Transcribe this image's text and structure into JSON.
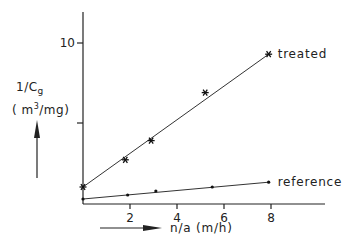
{
  "chart_data": {
    "type": "scatter",
    "title": "",
    "xlabel": "n/a  (m/h)",
    "ylabel": "1/Cg (m3/mg)",
    "ylabel_parts": {
      "main": "1/C",
      "sub": "g",
      "unit_open": "( m",
      "unit_sup": "3",
      "unit_close": "/mg)"
    },
    "xlim": [
      0,
      10.3
    ],
    "ylim": [
      0,
      11.5
    ],
    "x_ticks": [
      2,
      4,
      6,
      8
    ],
    "x_tick_labels": [
      "2",
      "4",
      "6",
      "8"
    ],
    "y_ticks": [
      5,
      10
    ],
    "y_tick_labels": [
      "",
      "10"
    ],
    "grid": false,
    "legend": "inline labels at line ends",
    "series": [
      {
        "name": "treated",
        "marker": "asterisk",
        "x": [
          0,
          1.8,
          2.9,
          5.2,
          7.9
        ],
        "y": [
          1.0,
          2.7,
          3.9,
          6.9,
          9.3
        ],
        "fit_line": {
          "x": [
            0,
            7.9
          ],
          "y": [
            1.0,
            9.3
          ]
        }
      },
      {
        "name": "reference",
        "marker": "dot",
        "x": [
          0,
          1.9,
          3.1,
          5.5,
          7.9
        ],
        "y": [
          0.25,
          0.5,
          0.75,
          1.0,
          1.3
        ],
        "fit_line": {
          "x": [
            0,
            7.9
          ],
          "y": [
            0.25,
            1.3
          ]
        }
      }
    ]
  }
}
